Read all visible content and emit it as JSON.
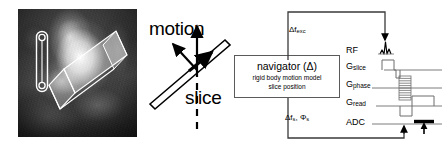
{
  "figure": {
    "accent_color": "#000000",
    "box_border_color": "#5a5a5a",
    "background_color": "#ffffff"
  },
  "mr_panel": {
    "name": "cardiac-mr-scout-image",
    "overlay_slice_label": "",
    "navigator_column_label": ""
  },
  "motion_panel": {
    "motion_label": "motion",
    "slice_label": "slice"
  },
  "navigator": {
    "title": "navigator (Δ)",
    "line1": "rigid body motion model",
    "line2": "slice position"
  },
  "loop": {
    "top_label_prefix": "Δf",
    "top_label_sub": "exc",
    "bottom_label_prefix": "Δf",
    "bottom_label_sub1": "s",
    "bottom_label_mid": ", Φ",
    "bottom_label_sub2": "s"
  },
  "sequence": {
    "rf_label": "RF",
    "gslice_prefix": "G",
    "gslice_sub": "slice",
    "gphase_prefix": "G",
    "gphase_sub": "phase",
    "gread_prefix": "G",
    "gread_sub": "read",
    "adc_label": "ADC"
  }
}
